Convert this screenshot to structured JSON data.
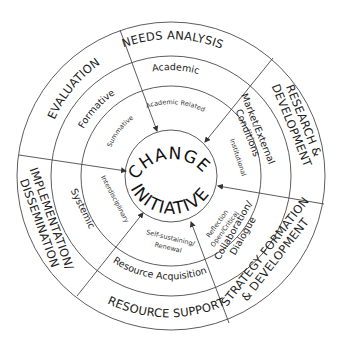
{
  "core": {
    "line1": "CHANGE",
    "line2": "INITIATIVE"
  },
  "outer_ring": {
    "needs_analysis": "NEEDS ANALYSIS",
    "research_line1": "RESEARCH &",
    "research_line2": "DEVELOPMENT",
    "strategy_line1": "STRATEGY FORMATION",
    "strategy_line2": "& DEVELOPMENT",
    "resource_support": "RESOURCE SUPPORT",
    "implementation_line1": "IMPLEMENTATION/",
    "implementation_line2": "DISSEMINATION",
    "evaluation": "EVALUATION"
  },
  "middle_ring": {
    "academic": "Academic",
    "market_line1": "Market/External",
    "market_line2": "Conditions",
    "collab_line1": "Collaboration/",
    "collab_line2": "Dialogue",
    "resource_acquisition": "Resource Acquisition",
    "systemic": "Systemic",
    "formative": "Formative"
  },
  "inner_ring": {
    "academic_related": "Academic Related",
    "institutional": "Institutional",
    "reflection_line1": "Reflection",
    "reflection_line2": "Open/Critical",
    "self_line1": "Self-sustaining/",
    "self_line2": "Renewal",
    "interdisciplinary": "Interdisciplinary",
    "summative": "Summative"
  },
  "colors": {
    "stroke": "#4a4a4a",
    "text": "#222222",
    "background": "#ffffff"
  }
}
